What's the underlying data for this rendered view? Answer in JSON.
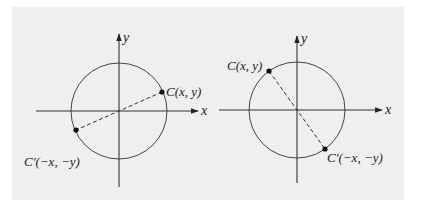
{
  "colors": {
    "background": "#ffffff",
    "panel": "#efefef",
    "ink": "#222222"
  },
  "figures": [
    {
      "name": "left-diagram",
      "axis_x_label": "x",
      "axis_y_label": "y",
      "point_c_label": "C(x, y)",
      "point_c_prime_label": "C′(−x, −y)",
      "point_c_position": "first quadrant (upper right)",
      "point_c_prime_position": "third quadrant (lower left)"
    },
    {
      "name": "right-diagram",
      "axis_x_label": "x",
      "axis_y_label": "y",
      "point_c_label": "C(x, y)",
      "point_c_prime_label": "C′(−x, −y)",
      "point_c_position": "second quadrant (upper left)",
      "point_c_prime_position": "fourth quadrant (lower right)"
    }
  ]
}
